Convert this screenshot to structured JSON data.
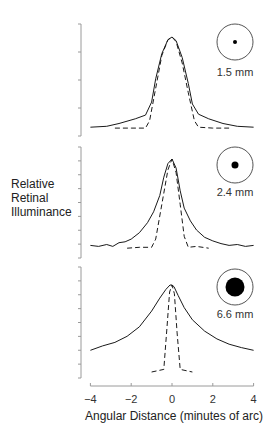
{
  "chart_data": [
    {
      "type": "line",
      "panel": "top",
      "pupil_label": "1.5 mm",
      "pupil_dot_radius": 2,
      "xlabel": "Angular Distance (minutes of arc)",
      "ylabel": "Relative Retinal Illuminance",
      "xlim": [
        -4,
        4
      ],
      "series": [
        {
          "name": "measured",
          "style": "solid",
          "x": [
            -4,
            -3.2,
            -2.6,
            -1.8,
            -1.3,
            -1.0,
            -0.8,
            -0.5,
            -0.2,
            0,
            0.2,
            0.5,
            0.8,
            1.0,
            1.3,
            1.8,
            2.5,
            3.2,
            4
          ],
          "y": [
            0.03,
            0.04,
            0.07,
            0.12,
            0.16,
            0.3,
            0.55,
            0.82,
            0.97,
            1.0,
            0.96,
            0.78,
            0.5,
            0.28,
            0.17,
            0.12,
            0.07,
            0.04,
            0.03
          ]
        },
        {
          "name": "diffraction-limited",
          "style": "dashed",
          "x": [
            -2.8,
            -2.0,
            -1.3,
            -1.1,
            -0.8,
            -0.5,
            -0.2,
            0,
            0.2,
            0.5,
            0.8,
            1.1,
            1.3,
            2.0,
            2.8
          ],
          "y": [
            0.02,
            0.02,
            0.02,
            0.1,
            0.45,
            0.8,
            0.97,
            1.0,
            0.95,
            0.72,
            0.4,
            0.1,
            0.03,
            0.02,
            0.02
          ]
        }
      ]
    },
    {
      "type": "line",
      "panel": "middle",
      "pupil_label": "2.4 mm",
      "pupil_dot_radius": 3.5,
      "xlim": [
        -4,
        4
      ],
      "series": [
        {
          "name": "measured",
          "style": "solid",
          "x": [
            -4,
            -3.6,
            -3.2,
            -2.9,
            -2.6,
            -2.3,
            -2.0,
            -1.6,
            -1.2,
            -0.9,
            -0.6,
            -0.4,
            -0.2,
            0,
            0.2,
            0.4,
            0.6,
            0.9,
            1.2,
            1.6,
            2.0,
            2.4,
            2.8,
            3.2,
            3.6,
            4
          ],
          "y": [
            0.05,
            0.04,
            0.06,
            0.04,
            0.08,
            0.09,
            0.12,
            0.19,
            0.3,
            0.42,
            0.6,
            0.8,
            0.95,
            1.0,
            0.9,
            0.65,
            0.46,
            0.32,
            0.22,
            0.14,
            0.1,
            0.07,
            0.05,
            0.06,
            0.04,
            0.05
          ]
        },
        {
          "name": "diffraction-limited",
          "style": "dashed",
          "x": [
            -2.2,
            -1.6,
            -1.0,
            -0.8,
            -0.5,
            -0.2,
            0,
            0.2,
            0.4,
            0.6,
            0.8,
            1.2,
            1.8
          ],
          "y": [
            0.02,
            0.03,
            0.03,
            0.12,
            0.5,
            0.88,
            1.0,
            0.85,
            0.5,
            0.15,
            0.03,
            0.04,
            0.02
          ]
        }
      ]
    },
    {
      "type": "line",
      "panel": "bottom",
      "pupil_label": "6.6 mm",
      "pupil_dot_radius": 9.5,
      "xlim": [
        -4,
        4
      ],
      "series": [
        {
          "name": "measured",
          "style": "solid",
          "x": [
            -4,
            -3.4,
            -2.8,
            -2.2,
            -1.6,
            -1.0,
            -0.6,
            -0.3,
            -0.1,
            0,
            0.1,
            0.3,
            0.6,
            1.0,
            1.6,
            2.2,
            2.8,
            3.4,
            4
          ],
          "y": [
            0.25,
            0.3,
            0.34,
            0.41,
            0.52,
            0.7,
            0.85,
            0.95,
            1.0,
            1.0,
            0.98,
            0.88,
            0.74,
            0.6,
            0.47,
            0.38,
            0.32,
            0.28,
            0.25
          ]
        },
        {
          "name": "diffraction-limited",
          "style": "dashed",
          "x": [
            -1.0,
            -0.4,
            -0.25,
            -0.12,
            0,
            0.12,
            0.25,
            0.4,
            1.0
          ],
          "y": [
            0.0,
            0.03,
            0.5,
            0.92,
            1.0,
            0.9,
            0.45,
            0.03,
            0.0
          ]
        }
      ]
    }
  ],
  "axis": {
    "x_ticks": [
      "-4",
      "-2",
      "0",
      "2",
      "4"
    ],
    "xlabel": "Angular Distance (minutes of arc)",
    "ylabel_lines": [
      "Relative",
      "Retinal",
      "Illuminance"
    ]
  },
  "caption_cutoff": "........"
}
